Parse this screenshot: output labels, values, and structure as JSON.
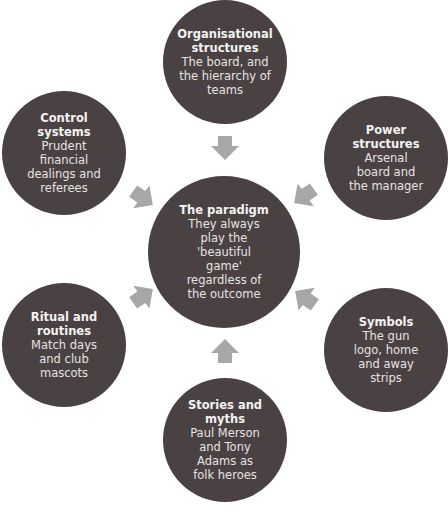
{
  "diagram": {
    "type": "cultural-web",
    "colors": {
      "node_fill": "#4a4242",
      "arrow_fill": "#a8a6a6",
      "text": "#f2f0f0",
      "background": "#ffffff"
    },
    "center": {
      "title": "The paradigm",
      "description": "They always\nplay the\n'beautiful\ngame'\nregardless of\nthe outcome"
    },
    "nodes": [
      {
        "id": "org",
        "title": "Organisational\nstructures",
        "description": "The board, and\nthe hierarchy of\nteams",
        "position": "top"
      },
      {
        "id": "power",
        "title": "Power\nstructures",
        "description": "Arsenal\nboard and\nthe manager",
        "position": "top-right"
      },
      {
        "id": "symbols",
        "title": "Symbols",
        "description": "The gun\nlogo, home\nand away\nstrips",
        "position": "bottom-right"
      },
      {
        "id": "stories",
        "title": "Stories and\nmyths",
        "description": "Paul Merson\nand Tony\nAdams as\nfolk heroes",
        "position": "bottom"
      },
      {
        "id": "ritual",
        "title": "Ritual and\nroutines",
        "description": "Match days\nand club\nmascots",
        "position": "bottom-left"
      },
      {
        "id": "control",
        "title": "Control\nsystems",
        "description": "Prudent\nfinancial\ndealings and\nreferees",
        "position": "top-left"
      }
    ],
    "edges": [
      {
        "from": "org",
        "to": "center"
      },
      {
        "from": "power",
        "to": "center"
      },
      {
        "from": "symbols",
        "to": "center"
      },
      {
        "from": "stories",
        "to": "center"
      },
      {
        "from": "ritual",
        "to": "center"
      },
      {
        "from": "control",
        "to": "center"
      }
    ]
  }
}
